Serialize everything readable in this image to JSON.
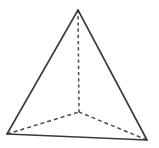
{
  "figure": {
    "kind": "tetrahedron-line-drawing",
    "canvas": {
      "width": 159,
      "height": 148
    },
    "background_color": "#ffffff",
    "stroke_color": "#3a3a3a",
    "hidden_stroke_color": "#4a4a4a",
    "face_fill_color": "#ffffff",
    "solid_stroke_width": 1.6,
    "hidden_stroke_width": 1.5,
    "hidden_dash_pattern": "4,3",
    "vertical_dash_pattern": "3.2,3",
    "vertices": [
      {
        "name": "apex",
        "label": "",
        "x": 78,
        "y": 10,
        "visible": true
      },
      {
        "name": "bottom-left",
        "label": "",
        "x": 7,
        "y": 134,
        "visible": true
      },
      {
        "name": "bottom-right",
        "label": "",
        "x": 147,
        "y": 140,
        "visible": true
      },
      {
        "name": "back-hidden",
        "label": "",
        "x": 79,
        "y": 112,
        "visible": false
      }
    ],
    "edges": [
      {
        "name": "edge-apex-bottom-left",
        "from": "apex",
        "to": "bottom-left",
        "style": "solid",
        "path": "M 78 10 L 7 134"
      },
      {
        "name": "edge-apex-bottom-right",
        "from": "apex",
        "to": "bottom-right",
        "style": "solid",
        "path": "M 78 10 L 147 140"
      },
      {
        "name": "edge-base-front",
        "from": "bottom-left",
        "to": "bottom-right",
        "style": "solid",
        "path": "M 7 134 L 147 140"
      },
      {
        "name": "edge-apex-back",
        "from": "apex",
        "to": "back-hidden",
        "style": "dashed",
        "path": "M 78 10 L 79 112"
      },
      {
        "name": "edge-bottom-left-back",
        "from": "bottom-left",
        "to": "back-hidden",
        "style": "dashed",
        "path": "M 7 134 L 79 112"
      },
      {
        "name": "edge-bottom-right-back",
        "from": "bottom-right",
        "to": "back-hidden",
        "style": "dashed",
        "path": "M 147 140 L 79 112"
      }
    ],
    "faces": [
      {
        "name": "face-front",
        "polygon": "78,10 7,134 147,140",
        "visible": true
      }
    ],
    "labels": []
  }
}
